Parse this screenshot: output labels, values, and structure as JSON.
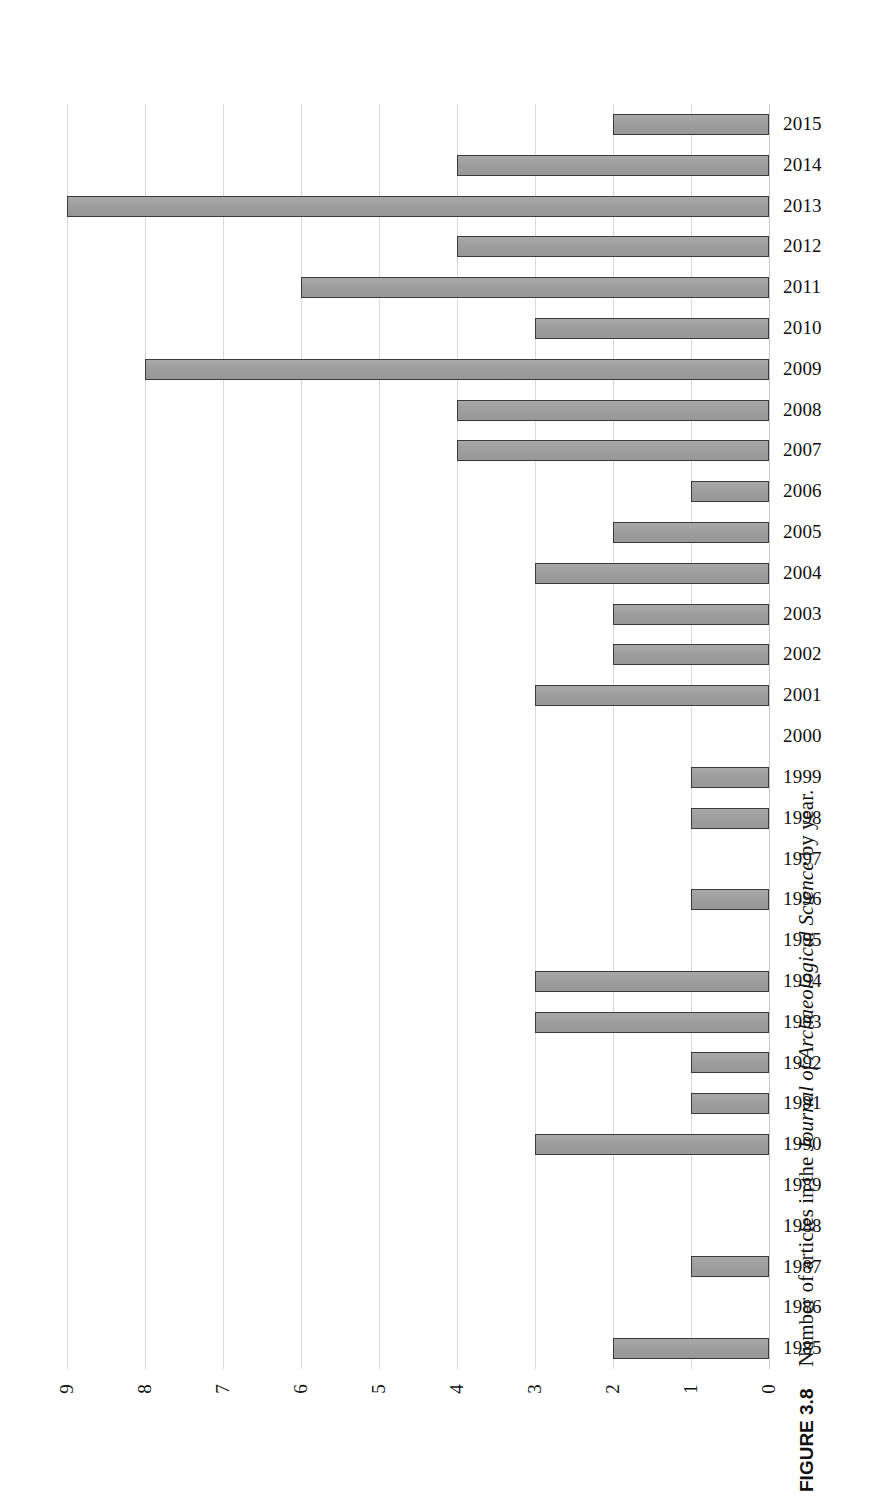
{
  "figure": {
    "label": "FIGURE 3.8",
    "caption_before": "Number of articles in the ",
    "caption_journal": "Journal of Archaeological Science",
    "caption_after": " by year."
  },
  "colors": {
    "bar_fill": "#a0a0a0",
    "bar_stroke": "#3a3a3a",
    "gridline": "#d9d9d9",
    "text": "#111111",
    "background": "#ffffff"
  },
  "chart_data": {
    "type": "bar",
    "orientation": "horizontal",
    "title": "",
    "subtitle": "",
    "xlabel": "",
    "ylabel": "",
    "xlim": [
      0,
      9
    ],
    "x_axis_reversed": true,
    "grid": true,
    "legend": "none",
    "x_ticks": [
      "9",
      "8",
      "7",
      "6",
      "5",
      "4",
      "3",
      "2",
      "1",
      "0"
    ],
    "categories": [
      "2015",
      "2014",
      "2013",
      "2012",
      "2011",
      "2010",
      "2009",
      "2008",
      "2007",
      "2006",
      "2005",
      "2004",
      "2003",
      "2002",
      "2001",
      "2000",
      "1999",
      "1998",
      "1997",
      "1996",
      "1995",
      "1994",
      "1993",
      "1992",
      "1991",
      "1990",
      "1989",
      "1988",
      "1987",
      "1986",
      "1985"
    ],
    "values": [
      2,
      4,
      9,
      4,
      6,
      3,
      8,
      4,
      4,
      1,
      2,
      3,
      2,
      2,
      3,
      0,
      1,
      1,
      0,
      1,
      0,
      3,
      3,
      1,
      1,
      3,
      0,
      0,
      1,
      0,
      2
    ],
    "series": [
      {
        "name": "Number of articles",
        "values": [
          2,
          4,
          9,
          4,
          6,
          3,
          8,
          4,
          4,
          1,
          2,
          3,
          2,
          2,
          3,
          0,
          1,
          1,
          0,
          1,
          0,
          3,
          3,
          1,
          1,
          3,
          0,
          0,
          1,
          0,
          2
        ]
      }
    ]
  }
}
